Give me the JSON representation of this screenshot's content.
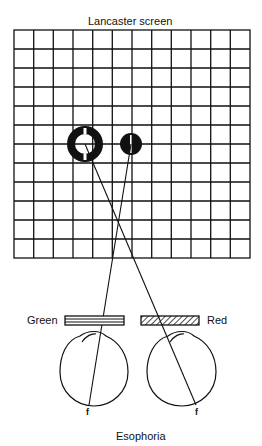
{
  "title": "Lancaster screen",
  "filters": {
    "left": "Green",
    "right": "Red"
  },
  "fovea_labels": {
    "left": "f",
    "right": "f"
  },
  "caption": "Esophoria",
  "grid": {
    "columns": 12,
    "rows": 12
  },
  "colors": {
    "ink": "#111111",
    "background": "#ffffff"
  }
}
